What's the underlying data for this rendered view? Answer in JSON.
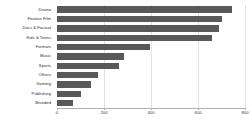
{
  "chart_data": {
    "type": "bar",
    "orientation": "horizontal",
    "title": "",
    "subtitle": "",
    "xlabel": "",
    "ylabel": "",
    "xlim": [
      0,
      800
    ],
    "ylim": null,
    "grid": true,
    "legend": null,
    "legend_position": "none",
    "bar_color": "#595959",
    "gridline_color": "#e2e2e2",
    "axis_color": "#b0b0b0",
    "xticks": [
      0,
      200,
      400,
      600,
      800
    ],
    "xtick_labels": [
      "0",
      "200",
      "400",
      "600",
      "800"
    ],
    "categories": [
      "Drama",
      "Feature Film",
      "Docs & Factual",
      "Kids & Teens",
      "Formats",
      "Music",
      "Sports",
      "Others",
      "Gaming",
      "Publishing",
      "Branded"
    ],
    "values": [
      745,
      700,
      690,
      660,
      395,
      285,
      265,
      175,
      145,
      100,
      70
    ],
    "series": [
      {
        "name": "Count",
        "values": [
          745,
          700,
          690,
          660,
          395,
          285,
          265,
          175,
          145,
          100,
          70
        ]
      }
    ],
    "annotations": []
  }
}
